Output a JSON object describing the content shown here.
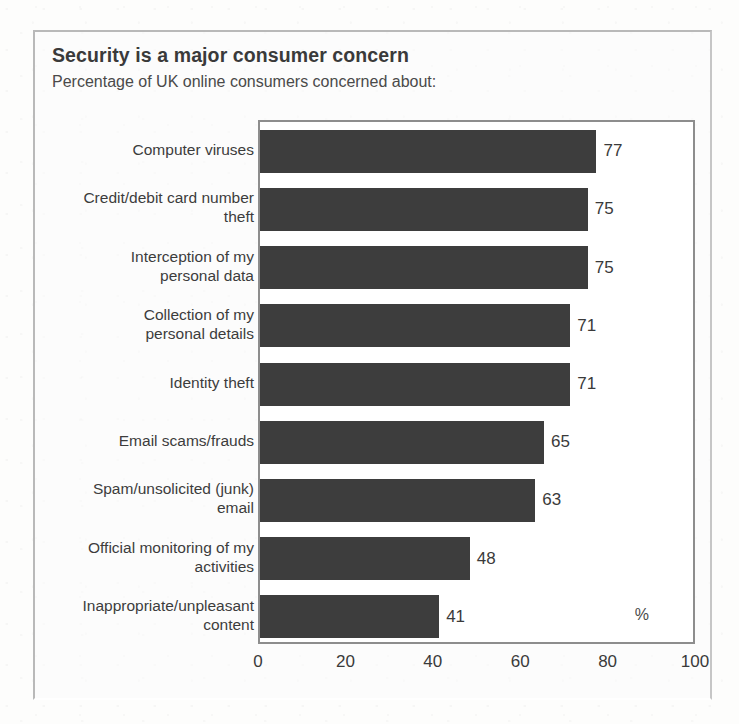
{
  "figure": {
    "title": "Security is a major consumer concern",
    "subtitle": "Percentage of UK online consumers concerned about:",
    "unit_mark": "%"
  },
  "chart_data": {
    "type": "bar",
    "orientation": "horizontal",
    "title": "Security is a major consumer concern",
    "subtitle": "Percentage of UK online consumers concerned about:",
    "xlabel": "%",
    "ylabel": "",
    "xlim": [
      0,
      100
    ],
    "xticks": [
      "0",
      "20",
      "40",
      "60",
      "80",
      "100"
    ],
    "grid": false,
    "legend": false,
    "bar_color": "#3d3d3d",
    "categories": [
      "Computer viruses",
      "Credit/debit card number theft",
      "Interception of my personal data",
      "Collection of my personal details",
      "Identity theft",
      "Email scams/frauds",
      "Spam/unsolicited (junk) email",
      "Official monitoring of my activities",
      "Inappropriate/unpleasant content"
    ],
    "category_lines": [
      [
        "Computer viruses"
      ],
      [
        "Credit/debit card number",
        "theft"
      ],
      [
        "Interception of my",
        "personal data"
      ],
      [
        "Collection of my",
        "personal details"
      ],
      [
        "Identity theft"
      ],
      [
        "Email scams/frauds"
      ],
      [
        "Spam/unsolicited (junk)",
        "email"
      ],
      [
        "Official monitoring of my",
        "activities"
      ],
      [
        "Inappropriate/unpleasant",
        "content"
      ]
    ],
    "values": [
      77,
      75,
      75,
      71,
      71,
      65,
      63,
      48,
      41
    ],
    "value_labels": [
      "77",
      "75",
      "75",
      "71",
      "71",
      "65",
      "63",
      "48",
      "41"
    ]
  }
}
